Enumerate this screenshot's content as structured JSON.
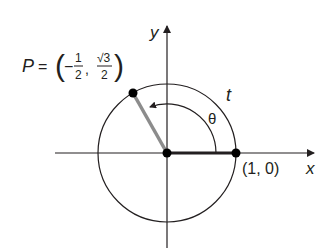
{
  "diagram": {
    "type": "unit-circle",
    "axes": {
      "x_label": "x",
      "y_label": "y"
    },
    "point_p": {
      "name": "P",
      "equals": "=",
      "x_num": "1",
      "x_den": "2",
      "x_sign": "−",
      "y_num": "√3",
      "y_den": "2",
      "comma": ",",
      "open": "(",
      "close": ")"
    },
    "point_a": {
      "label": "(1, 0)"
    },
    "arc_label": "t",
    "angle_label": "θ",
    "colors": {
      "line": "#231f20",
      "radius_terminal": "#8c8c8c",
      "point": "#000000"
    }
  }
}
